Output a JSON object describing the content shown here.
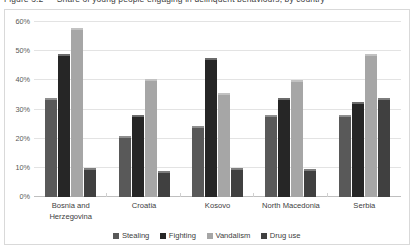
{
  "caption": {
    "text": "Figure 3.2 —  Share of young people engaging in delinquent behaviours, by country"
  },
  "chart_data": {
    "type": "bar",
    "title": "",
    "subtitle": "",
    "xlabel": "",
    "ylabel": "",
    "ylim": [
      0,
      60
    ],
    "ytick_labels": [
      "60%",
      "50%",
      "40%",
      "30%",
      "20%",
      "10%",
      "0%"
    ],
    "ytick_values": [
      60,
      50,
      40,
      30,
      20,
      10,
      0
    ],
    "grid": true,
    "legend_position": "bottom",
    "value_suffix": "%",
    "categories": [
      "Bosnia and Herzegovina",
      "Croatia",
      "Kosovo",
      "North Macedonia",
      "Serbia"
    ],
    "category_lines": [
      [
        "Bosnia and",
        "Herzegovina"
      ],
      [
        "Croatia"
      ],
      [
        "Kosovo"
      ],
      [
        "North Macedonia"
      ],
      [
        "Serbia"
      ]
    ],
    "series": [
      {
        "name": "Stealing",
        "color": "#595959",
        "values": [
          34,
          21,
          24.5,
          28,
          28
        ]
      },
      {
        "name": "Fighting",
        "color": "#262626",
        "values": [
          49,
          28,
          47.5,
          34,
          32.5
        ]
      },
      {
        "name": "Vandalism",
        "color": "#a6a6a6",
        "values": [
          58,
          40.5,
          35.5,
          40,
          49
        ]
      },
      {
        "name": "Drug use",
        "color": "#404040",
        "values": [
          10,
          9,
          10,
          9.5,
          34
        ]
      }
    ]
  }
}
